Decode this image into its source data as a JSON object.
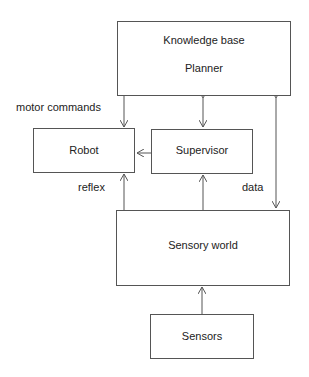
{
  "diagram": {
    "nodes": [
      {
        "id": "planner",
        "lines": [
          "Knowledge base",
          "Planner"
        ]
      },
      {
        "id": "robot",
        "label": "Robot"
      },
      {
        "id": "supervisor",
        "label": "Supervisor"
      },
      {
        "id": "sensory_world",
        "label": "Sensory world"
      },
      {
        "id": "sensors",
        "label": "Sensors"
      }
    ],
    "edge_labels": {
      "motor_commands": "motor commands",
      "reflex": "reflex",
      "data": "data"
    },
    "edges": [
      {
        "from": "planner",
        "to": "robot",
        "label": "motor commands"
      },
      {
        "from": "planner",
        "to": "supervisor",
        "bidirectional": true
      },
      {
        "from": "planner",
        "to": "sensory_world",
        "bidirectional": true,
        "label": "data"
      },
      {
        "from": "supervisor",
        "to": "robot"
      },
      {
        "from": "sensory_world",
        "to": "robot",
        "label": "reflex"
      },
      {
        "from": "sensory_world",
        "to": "supervisor"
      },
      {
        "from": "sensors",
        "to": "sensory_world"
      }
    ]
  }
}
